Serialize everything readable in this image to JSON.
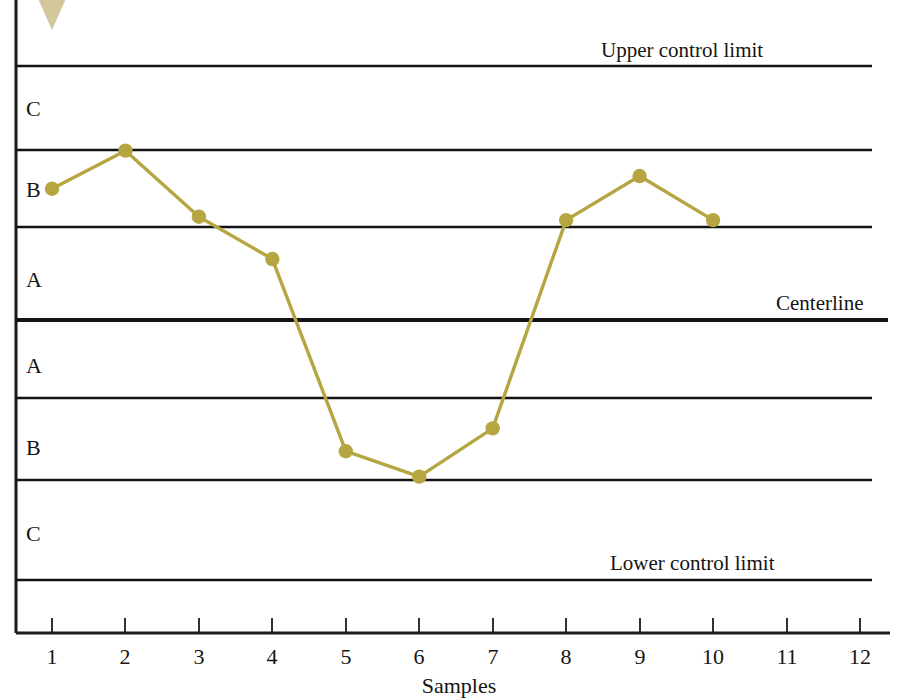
{
  "chart_data": {
    "type": "line",
    "title": "",
    "subtitle": "",
    "xlabel": "Samples",
    "ylabel": "",
    "grid": true,
    "legend_position": "none",
    "x": [
      1,
      2,
      3,
      4,
      5,
      6,
      7,
      8,
      9,
      10
    ],
    "x_tick_labels": [
      "1",
      "2",
      "3",
      "4",
      "5",
      "6",
      "7",
      "8",
      "9",
      "10",
      "11",
      "12"
    ],
    "xlim": [
      0.5,
      12.5
    ],
    "series": [
      {
        "name": "sample-measurements",
        "color": "#b5a642",
        "marker": "circle",
        "values": [
          1.55,
          2.0,
          1.22,
          0.72,
          -1.55,
          -1.85,
          -1.28,
          1.18,
          1.7,
          1.18
        ]
      }
    ],
    "y_zone_boundaries": [
      {
        "value": 3,
        "label": "Upper control limit",
        "kind": "ucl",
        "y_px": 66
      },
      {
        "value": 2,
        "label": "",
        "kind": "zone",
        "y_px": 150
      },
      {
        "value": 1,
        "label": "",
        "kind": "zone",
        "y_px": 227
      },
      {
        "value": 0,
        "label": "Centerline",
        "kind": "centerline",
        "y_px": 320
      },
      {
        "value": -1,
        "label": "",
        "kind": "zone",
        "y_px": 398
      },
      {
        "value": -2,
        "label": "",
        "kind": "zone",
        "y_px": 480
      },
      {
        "value": -3,
        "label": "Lower control limit",
        "kind": "lcl",
        "y_px": 580
      }
    ],
    "zone_band_labels": [
      {
        "label": "C",
        "y_px": 116
      },
      {
        "label": "B",
        "y_px": 197
      },
      {
        "label": "A",
        "y_px": 287
      },
      {
        "label": "A",
        "y_px": 373
      },
      {
        "label": "B",
        "y_px": 455
      },
      {
        "label": "C",
        "y_px": 541
      }
    ],
    "annotations": [
      {
        "name": "out-of-control-arrow",
        "shape": "triangle-down",
        "color": "#d2c89c"
      }
    ]
  },
  "labels": {
    "upper_control_limit": "Upper control limit",
    "centerline": "Centerline",
    "lower_control_limit": "Lower control limit",
    "x_axis_title": "Samples"
  },
  "colors": {
    "series": "#b5a642",
    "arrow": "#d2c89c",
    "line": "#131313"
  }
}
